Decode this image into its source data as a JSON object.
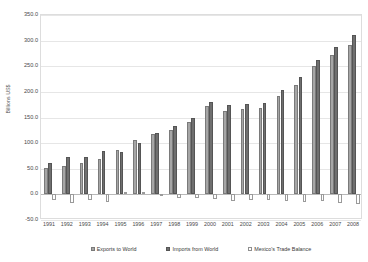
{
  "chart_data": {
    "type": "bar",
    "title": "",
    "xlabel": "",
    "ylabel": "Billions US$",
    "ylim": [
      -50.0,
      350.0
    ],
    "ytick_step": 50.0,
    "grid": true,
    "legend_position": "bottom",
    "categories": [
      "1991",
      "1992",
      "1993",
      "1994",
      "1995",
      "1996",
      "1997",
      "1998",
      "1999",
      "2000",
      "2001",
      "2002",
      "2003",
      "2004",
      "2005",
      "2006",
      "2007",
      "2008"
    ],
    "ytick_labels": [
      "350.0",
      "300.0",
      "250.0",
      "200.0",
      "150.0",
      "100.0",
      "50.0",
      "0.0",
      "-50.0"
    ],
    "ytick_values": [
      350.0,
      300.0,
      250.0,
      200.0,
      150.0,
      100.0,
      50.0,
      0.0,
      -50.0
    ],
    "series": [
      {
        "name": "Exports to World",
        "color": "#a6a6a6",
        "values": [
          51.0,
          56.0,
          61.0,
          70.0,
          87.0,
          106.0,
          117.0,
          125.0,
          142.0,
          172.0,
          162.0,
          166.0,
          169.0,
          191.0,
          214.0,
          250.0,
          272.0,
          292.0
        ]
      },
      {
        "name": "Imports from World",
        "color": "#6f6f6f",
        "values": [
          62.0,
          73.0,
          72.0,
          85.0,
          83.0,
          101.0,
          120.0,
          133.0,
          149.0,
          181.0,
          174.0,
          177.0,
          179.0,
          203.0,
          229.0,
          263.0,
          288.0,
          311.0
        ]
      },
      {
        "name": "Mexico's Trade Balance",
        "color": "#ffffff",
        "values": [
          -11.0,
          -17.0,
          -11.0,
          -15.0,
          4.0,
          5.0,
          -3.0,
          -8.0,
          -7.0,
          -9.0,
          -12.0,
          -11.0,
          -10.0,
          -12.0,
          -15.0,
          -13.0,
          -16.0,
          -19.0
        ]
      }
    ]
  },
  "legend": {
    "items": [
      {
        "label": "Exports to World"
      },
      {
        "label": "Imports from World"
      },
      {
        "label": "Mexico's Trade Balance"
      }
    ]
  },
  "axis": {
    "y_title": "Billions US$"
  }
}
